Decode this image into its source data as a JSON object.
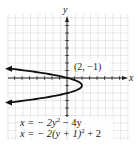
{
  "chart_data": {
    "type": "line",
    "title": "",
    "xlabel": "x",
    "ylabel": "y",
    "grid": true,
    "xlim": [
      -8,
      8
    ],
    "ylim": [
      -8,
      9
    ],
    "series": [
      {
        "name": "x = -2y^2 - 4y",
        "curve": "parabola opening left",
        "vertex": [
          2,
          -1
        ],
        "points": [
          [
            -5.5,
            1.5
          ],
          [
            -4,
            1.0
          ],
          [
            -2.5,
            0.5
          ],
          [
            0,
            0
          ],
          [
            1.5,
            -0.5
          ],
          [
            2,
            -1
          ],
          [
            1.5,
            -1.5
          ],
          [
            0,
            -2
          ],
          [
            -2.5,
            -2.5
          ],
          [
            -4,
            -3.0
          ],
          [
            -5.5,
            -3.5
          ]
        ]
      }
    ],
    "annotations": [
      {
        "text": "(2, −1)",
        "at": [
          2,
          -1
        ]
      }
    ]
  },
  "labels": {
    "x_axis": "x",
    "y_axis": "y",
    "vertex": "(2, −1)",
    "equation1_pre": "x = − 2y",
    "equation1_exp": "2",
    "equation1_post": " − 4y",
    "equation2_pre": "x = − 2(y + 1)",
    "equation2_exp": "2",
    "equation2_post": " + 2"
  }
}
